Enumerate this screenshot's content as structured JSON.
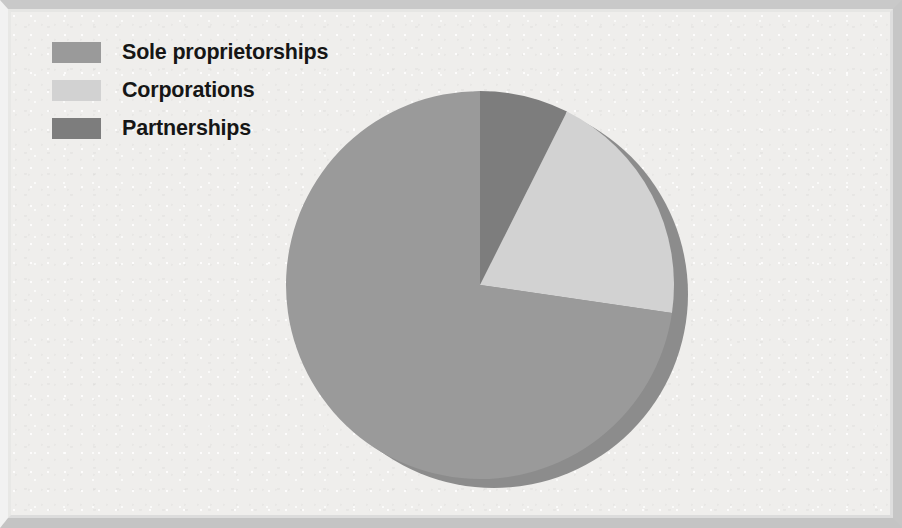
{
  "figure": {
    "background_color": "#efeeec",
    "frame_color": "#c6c6c6"
  },
  "legend": {
    "position": "top-left",
    "items": [
      {
        "label": "Sole proprietorships",
        "color": "#9a9a9a",
        "swatch_name": "legend-swatch-sole-proprietorships"
      },
      {
        "label": "Corporations",
        "color": "#d2d2d2",
        "swatch_name": "legend-swatch-corporations"
      },
      {
        "label": "Partnerships",
        "color": "#7d7d7d",
        "swatch_name": "legend-swatch-partnerships"
      }
    ]
  },
  "chart_data": {
    "type": "pie",
    "title": "",
    "subtitle": "",
    "xlabel": "",
    "ylabel": "",
    "grid": false,
    "legend_position": "top-left",
    "start_angle_deg": 0,
    "direction": "clockwise",
    "categories": [
      "Partnerships",
      "Corporations",
      "Sole proprietorships"
    ],
    "values": [
      7.4,
      19.9,
      72.6
    ],
    "value_unit": "%",
    "colors": [
      "#7d7d7d",
      "#d2d2d2",
      "#9a9a9a"
    ],
    "data_labels": [
      "7.4%",
      "19.9%",
      "72.6%"
    ],
    "slices": [
      {
        "name": "Partnerships",
        "value": 7.4,
        "label": "7.4%",
        "color": "#7d7d7d",
        "start_deg": 0.0,
        "end_deg": 26.64
      },
      {
        "name": "Corporations",
        "value": 19.9,
        "label": "19.9%",
        "color": "#d2d2d2",
        "start_deg": 26.64,
        "end_deg": 98.28
      },
      {
        "name": "Sole proprietorships",
        "value": 72.6,
        "label": "72.6%",
        "color": "#9a9a9a",
        "start_deg": 98.28,
        "end_deg": 360.0
      }
    ],
    "shadow": {
      "color": "#8c8c8c",
      "offset_x": 14,
      "offset_y": 9
    },
    "geometry": {
      "center_x": 480,
      "center_y": 285,
      "radius": 194
    }
  },
  "labels": {
    "partnerships_label": "7.4%",
    "corporations_label": "19.9%",
    "sole_label": "72.6%"
  }
}
